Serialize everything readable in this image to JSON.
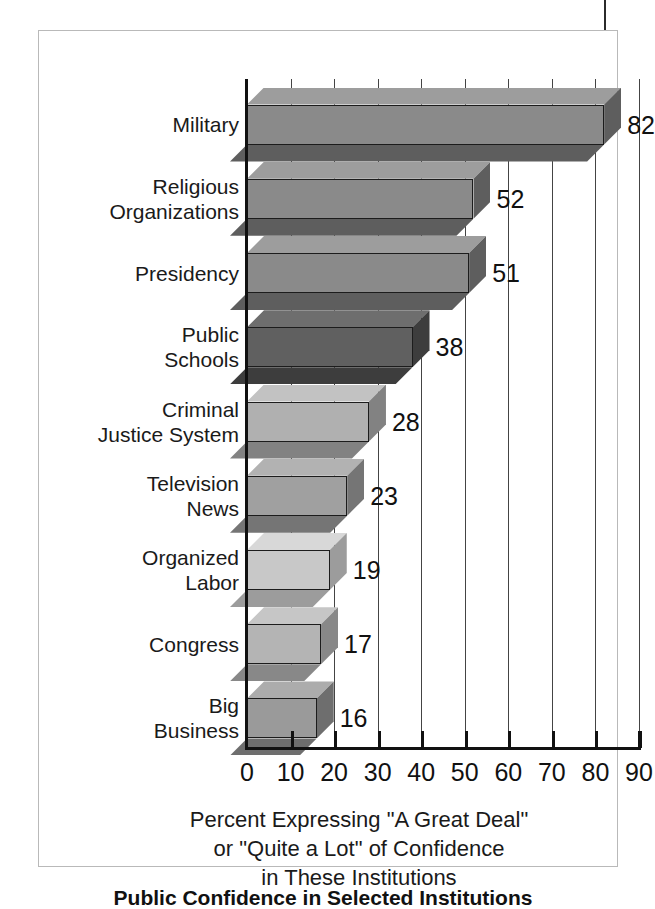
{
  "figure": {
    "caption": "Public Confidence in Selected Institutions"
  },
  "chart_data": {
    "type": "bar",
    "orientation": "horizontal",
    "title": "",
    "xlabel": "Percent Expressing \"A Great Deal\" or \"Quite a Lot\" of Confidence in These Institutions",
    "ylabel": "",
    "xlim": [
      0,
      90
    ],
    "grid": true,
    "legend": "none",
    "categories": [
      "Military",
      "Religious Organizations",
      "Presidency",
      "Public Schools",
      "Criminal Justice System",
      "Television News",
      "Organized Labor",
      "Congress",
      "Big Business"
    ],
    "values": [
      82,
      52,
      51,
      38,
      28,
      23,
      19,
      17,
      16
    ],
    "xticks": [
      0,
      10,
      20,
      30,
      40,
      50,
      60,
      70,
      80,
      90
    ],
    "xtick_labels": [
      "0",
      "10",
      "20",
      "30",
      "40",
      "50",
      "60",
      "70",
      "80",
      "90"
    ],
    "bar_colors": [
      "#8a8a8a",
      "#8a8a8a",
      "#8a8a8a",
      "#606060",
      "#b0b0b0",
      "#a0a0a0",
      "#c8c8c8",
      "#b4b4b4",
      "#9a9a9a"
    ],
    "bar_side_colors": [
      "#5e5e5e",
      "#5e5e5e",
      "#5e5e5e",
      "#3d3d3d",
      "#828282",
      "#757575",
      "#9c9c9c",
      "#888888",
      "#6e6e6e"
    ],
    "bar_top_colors": [
      "#9d9d9d",
      "#9d9d9d",
      "#9d9d9d",
      "#6e6e6e",
      "#c2c2c2",
      "#b2b2b2",
      "#d8d8d8",
      "#c6c6c6",
      "#acacac"
    ],
    "value_labels": [
      "82",
      "52",
      "51",
      "38",
      "28",
      "23",
      "19",
      "17",
      "16"
    ]
  },
  "category_lines": [
    "Military",
    "Religious\nOrganizations",
    "Presidency",
    "Public\nSchools",
    "Criminal\nJustice System",
    "Television\nNews",
    "Organized\nLabor",
    "Congress",
    "Big\nBusiness"
  ],
  "axis_title_lines": [
    "Percent Expressing \"A Great Deal\"",
    "or \"Quite a Lot\" of Confidence",
    "in These Institutions"
  ]
}
